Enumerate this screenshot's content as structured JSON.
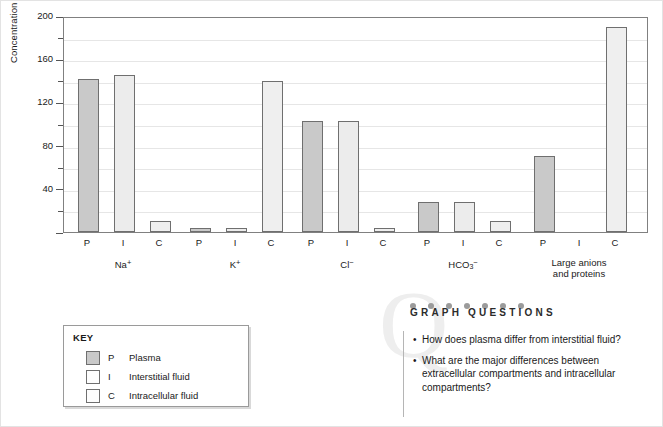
{
  "chart_data": {
    "type": "bar",
    "title": "",
    "xlabel": "",
    "ylabel": "Concentration (mmol / L)",
    "ylim": [
      0,
      200
    ],
    "y_ticks_major": [
      0,
      40,
      80,
      120,
      160,
      200
    ],
    "y_tick_labels": [
      "",
      "40",
      "80",
      "120",
      "160",
      "200"
    ],
    "y_ticks_minor": [
      20,
      60,
      100,
      140,
      180
    ],
    "grid": true,
    "legend_position": "below-left",
    "categories": [
      "Na⁺",
      "K⁺",
      "Cl⁻",
      "HCO₃⁻",
      "Large anions and proteins"
    ],
    "subcategories": [
      "P",
      "I",
      "C"
    ],
    "series": [
      {
        "name": "Plasma",
        "key": "P",
        "values": [
          142,
          4,
          103,
          28,
          70
        ]
      },
      {
        "name": "Interstitial fluid",
        "key": "I",
        "values": [
          145,
          4,
          103,
          28,
          0
        ]
      },
      {
        "name": "Intracellular fluid",
        "key": "C",
        "values": [
          10,
          140,
          4,
          10,
          190
        ]
      }
    ],
    "groups": [
      {
        "label": "Na",
        "sup": "+",
        "sub": "",
        "bars": [
          {
            "key": "P",
            "label": "P",
            "value": 142
          },
          {
            "key": "I",
            "label": "I",
            "value": 145
          },
          {
            "key": "C",
            "label": "C",
            "value": 10
          }
        ]
      },
      {
        "label": "K",
        "sup": "+",
        "sub": "",
        "bars": [
          {
            "key": "P",
            "label": "P",
            "value": 4
          },
          {
            "key": "I",
            "label": "I",
            "value": 4
          },
          {
            "key": "C",
            "label": "C",
            "value": 140
          }
        ]
      },
      {
        "label": "Cl",
        "sup": "−",
        "sub": "",
        "bars": [
          {
            "key": "P",
            "label": "P",
            "value": 103
          },
          {
            "key": "I",
            "label": "I",
            "value": 103
          },
          {
            "key": "C",
            "label": "C",
            "value": 4
          }
        ]
      },
      {
        "label": "HCO",
        "sup": "−",
        "sub": "3",
        "bars": [
          {
            "key": "P",
            "label": "P",
            "value": 28
          },
          {
            "key": "I",
            "label": "I",
            "value": 28
          },
          {
            "key": "C",
            "label": "C",
            "value": 10
          }
        ]
      },
      {
        "label": "Large anions\nand proteins",
        "sup": "",
        "sub": "",
        "bars": [
          {
            "key": "P",
            "label": "P",
            "value": 70
          },
          {
            "key": "I",
            "label": "I",
            "value": 0
          },
          {
            "key": "C",
            "label": "C",
            "value": 190
          }
        ]
      }
    ],
    "colors": {
      "plasma": "#c9c9c9",
      "interstitial": "#ececec",
      "intracellular": "#efefef",
      "bar_border": "#6f6f6f",
      "gridline": "#e6e6e6",
      "axis": "#808080"
    }
  },
  "key": {
    "title": "KEY",
    "items": [
      {
        "abbr": "P",
        "label": "Plasma",
        "swatch": "plasma-swatch"
      },
      {
        "abbr": "I",
        "label": "Interstitial fluid",
        "swatch": "interstitial-swatch"
      },
      {
        "abbr": "C",
        "label": "Intracellular fluid",
        "swatch": "intracellular-swatch"
      }
    ]
  },
  "graph_questions": {
    "heading": "GRAPH QUESTIONS",
    "watermark": "Q",
    "dot_count": 7,
    "questions": [
      "How does plasma differ from interstitial fluid?",
      "What are the major differences between extracellular compartments and intracellular compartments?"
    ]
  }
}
